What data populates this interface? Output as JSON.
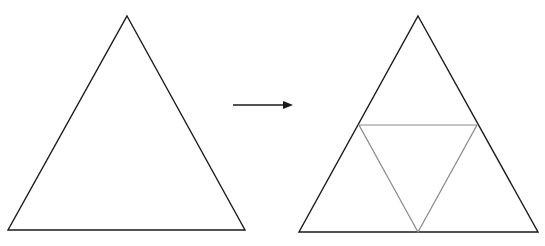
{
  "diagram": {
    "colors": {
      "outline": "#1a1a1a",
      "midpoint_lines": "#8a8a8a",
      "arrow": "#1a1a1a",
      "background": "#ffffff"
    },
    "left_triangle": {
      "apex": [
        127,
        16
      ],
      "base_left": [
        8,
        230
      ],
      "base_right": [
        245,
        230
      ]
    },
    "arrow": {
      "from": [
        233,
        105
      ],
      "to": [
        293,
        105
      ]
    },
    "right_triangle": {
      "apex": [
        418,
        16
      ],
      "base_left": [
        299,
        232
      ],
      "base_right": [
        538,
        232
      ],
      "inner_triangle": {
        "left_mid": [
          359,
          125
        ],
        "right_mid": [
          477,
          125
        ],
        "bottom_mid": [
          418,
          232
        ]
      }
    }
  }
}
